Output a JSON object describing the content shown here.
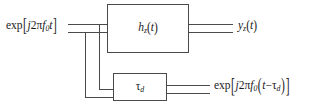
{
  "diagram": {
    "type": "signal-flow block diagram",
    "background_color": "#ffffff",
    "line_color": "#4a4a4a",
    "text_color": "#1a1a1a",
    "input": {
      "name": "complex-exponential-input",
      "text": "exp[j2πf0t]",
      "parts": {
        "func": "exp",
        "bracket_open": "[",
        "j": "j",
        "two": "2",
        "pi": "π",
        "f": "f",
        "f_sub": "0",
        "t": "t",
        "bracket_close": "]"
      }
    },
    "blocks": [
      {
        "name": "filter-block",
        "label": "hz(t)",
        "parts": {
          "h": "h",
          "h_sub": "z",
          "open": "(",
          "t": "t",
          "close": ")"
        }
      },
      {
        "name": "delay-block",
        "label": "τd",
        "parts": {
          "tau": "τ",
          "tau_sub": "d"
        }
      }
    ],
    "outputs": [
      {
        "name": "filter-output",
        "text": "yz(t)",
        "parts": {
          "y": "y",
          "y_sub": "z",
          "open": "(",
          "t": "t",
          "close": ")"
        }
      },
      {
        "name": "delay-output",
        "text": "exp[j2πf0(t−τd)]",
        "parts": {
          "func": "exp",
          "bracket_open": "[",
          "j": "j",
          "two": "2",
          "pi": "π",
          "f": "f",
          "f_sub": "0",
          "paren_open": "(",
          "t": "t",
          "minus": "−",
          "tau": "τ",
          "tau_sub": "d",
          "paren_close": ")",
          "bracket_close": "]"
        }
      }
    ]
  }
}
